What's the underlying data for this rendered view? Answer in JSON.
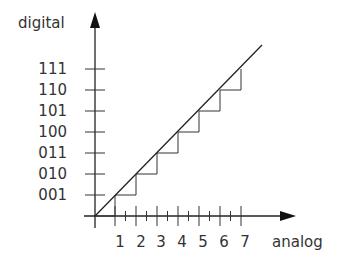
{
  "diagram": {
    "y_axis_label": "digital",
    "x_axis_label": "analog",
    "y_ticks": [
      "001",
      "010",
      "011",
      "100",
      "101",
      "110",
      "111"
    ],
    "x_ticks": [
      "1",
      "2",
      "3",
      "4",
      "5",
      "6",
      "7"
    ],
    "colors": {
      "line": "#222222",
      "text": "#333333",
      "background": "#ffffff"
    }
  }
}
